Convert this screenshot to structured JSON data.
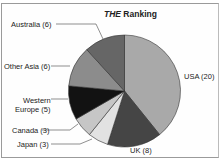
{
  "chart_data": {
    "type": "pie",
    "title": "THE Ranking",
    "title_italic_part": "THE",
    "title_rest": " Ranking",
    "start_angle_deg": 0,
    "direction": "clockwise",
    "slices": [
      {
        "label": "USA",
        "value": 20,
        "color": "#a9a9a9"
      },
      {
        "label": "UK",
        "value": 8,
        "color": "#454545"
      },
      {
        "label": "Japan",
        "value": 3,
        "color": "#e2e2e2"
      },
      {
        "label": "Canada",
        "value": 3,
        "color": "#c6c6c6"
      },
      {
        "label": "Western Europe",
        "value": 5,
        "color": "#121212"
      },
      {
        "label": "Other Asia",
        "value": 6,
        "color": "#8c8c8c"
      },
      {
        "label": "Australia",
        "value": 6,
        "color": "#666666"
      }
    ],
    "legend": "none (leader-line labels)"
  },
  "labels": {
    "usa": "USA (20)",
    "uk": "UK (8)",
    "japan": "Japan (3)",
    "canada": "Canada (3)",
    "weu_line1": "Western",
    "weu_line2": "Europe (5)",
    "other_asia": "Other Asia (6)",
    "australia": "Australia (6)"
  }
}
